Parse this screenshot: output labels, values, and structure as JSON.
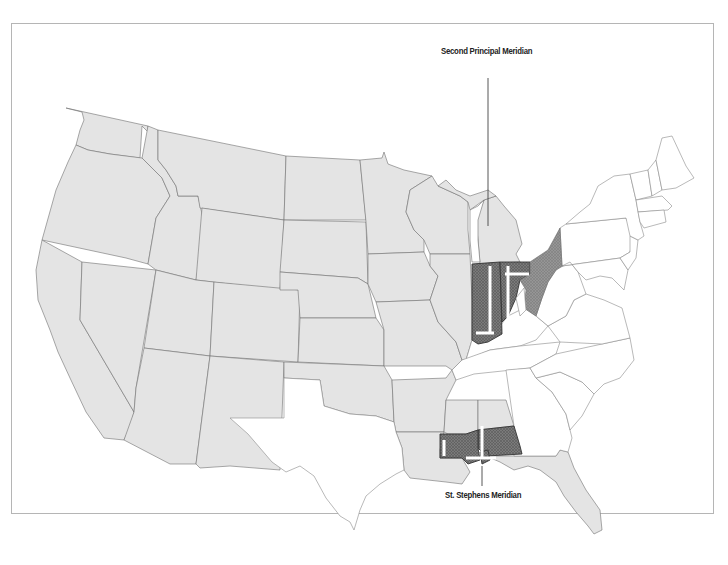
{
  "map": {
    "title": "Principal Meridians: Second Principal Meridian and St. Stephens Meridian",
    "labels": {
      "top": "Second Principal Meridian",
      "bottom": "St. Stephens Meridian"
    },
    "colors": {
      "public_land_states": "#e4e4e4",
      "non_public_land_states": "#ffffff",
      "meridian_region_dark": "#6e6e6e",
      "meridian_region_mid": "#8c8c8c",
      "state_border": "#707070",
      "frame_border": "#b5b5b5",
      "baseline": "#ffffff"
    },
    "regions": {
      "second_principal_meridian": [
        "Indiana",
        "Ohio (western)",
        "Illinois (eastern edge)"
      ],
      "st_stephens_meridian": [
        "Alabama (southern)",
        "Mississippi (southern)"
      ]
    }
  }
}
